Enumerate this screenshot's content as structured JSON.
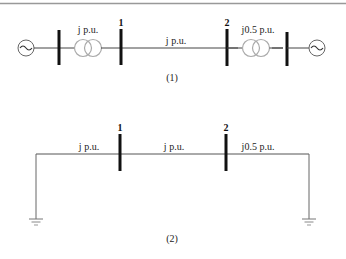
{
  "diagram1": {
    "caption": "(1)",
    "bus1_label": "1",
    "bus2_label": "2",
    "transformer1_label": "j p.u.",
    "line_label": "j p.u.",
    "transformer2_label": "j0.5 p.u.",
    "generator_symbol": "~"
  },
  "diagram2": {
    "caption": "(2)",
    "bus1_label": "1",
    "bus2_label": "2",
    "left_reactance_label": "j p.u.",
    "line_label": "j p.u.",
    "right_reactance_label": "j0.5 p.u."
  },
  "colors": {
    "line": "#444444",
    "bus": "#111111",
    "transformer": "#aaaaaa",
    "border": "#888888"
  }
}
